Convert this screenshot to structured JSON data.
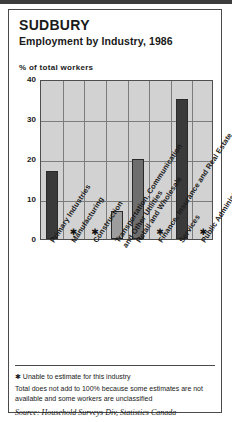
{
  "card": {
    "title": "SUDBURY",
    "subtitle": "Employment by Industry, 1986",
    "axis_note": "% of total workers"
  },
  "footnotes": {
    "star_symbol": "✱",
    "star_text": "Unable to estimate for this industry",
    "total_note": "Total does not add to 100% because some estimates are not available and some workers are unclassified",
    "source": "Source: Household Surveys Div, Statistics Canada"
  },
  "chart_data": {
    "type": "bar",
    "title": "Employment by Industry, 1986",
    "subtitle": "SUDBURY",
    "xlabel": "",
    "ylabel": "% of total workers",
    "ylim": [
      0,
      40
    ],
    "yticks": [
      0,
      10,
      20,
      30,
      40
    ],
    "ytick_labels": [
      "0",
      "10",
      "20",
      "30",
      "40"
    ],
    "grid": true,
    "legend": false,
    "categories": [
      "Primary Industries",
      "Manufacturing",
      "Construction",
      "Transportation, Communication and Other Utilities",
      "Retail and Wholesale",
      "Finance, Insurance and Real Estate",
      "Services",
      "Public Administration"
    ],
    "category_lines": [
      [
        "Primary Industries"
      ],
      [
        "Manufacturing"
      ],
      [
        "Construction"
      ],
      [
        "Transportation, Communication",
        "and Other Utilities"
      ],
      [
        "Retail and Wholesale"
      ],
      [
        "Finance, Insurance and Real Estate"
      ],
      [
        "Services"
      ],
      [
        "Public Administration"
      ]
    ],
    "values": [
      17,
      null,
      null,
      7,
      20,
      null,
      35,
      null
    ],
    "bar_colors": [
      "#3a3a3a",
      null,
      null,
      "#9d9d9d",
      "#6e6e6e",
      null,
      "#3a3a3a",
      null
    ],
    "missing_marker": "✱",
    "missing_note": "Unable to estimate for this industry",
    "plot_background": "#d2d2d2",
    "gridline_color": "#7c7c7c"
  }
}
